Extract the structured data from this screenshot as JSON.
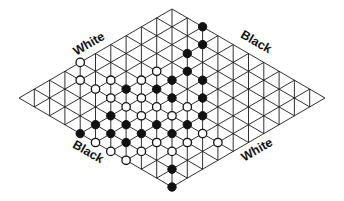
{
  "diagram": {
    "type": "hex-board",
    "size": 11,
    "geometry": {
      "left_corner": [
        19,
        98
      ],
      "step_a": [
        15.3,
        -8.9
      ],
      "step_b": [
        15.3,
        8.9
      ],
      "stone_radius": 4.2
    },
    "colors": {
      "line": "#1a1a1a",
      "black": "#111111",
      "white": "#ffffff"
    },
    "labels": [
      {
        "id": "top-left",
        "text": "White",
        "x": 89,
        "y": 44,
        "angle": -30
      },
      {
        "id": "top-right",
        "text": "Black",
        "x": 256,
        "y": 42,
        "angle": 30
      },
      {
        "id": "bottom-left",
        "text": "Black",
        "x": 88,
        "y": 152,
        "angle": 30
      },
      {
        "id": "bottom-right",
        "text": "White",
        "x": 257,
        "y": 150,
        "angle": -30
      }
    ],
    "black_stones": [
      [
        10,
        2
      ],
      [
        9,
        3
      ],
      [
        8,
        3
      ],
      [
        7,
        4
      ],
      [
        6,
        4
      ],
      [
        7,
        5
      ],
      [
        5,
        4
      ],
      [
        4,
        3
      ],
      [
        5,
        5
      ],
      [
        6,
        6
      ],
      [
        5,
        7
      ],
      [
        4,
        7
      ],
      [
        3,
        6
      ],
      [
        2,
        4
      ],
      [
        1,
        4
      ],
      [
        0,
        4
      ],
      [
        2,
        5
      ],
      [
        1,
        5
      ],
      [
        2,
        6
      ],
      [
        3,
        7
      ],
      [
        1,
        6
      ],
      [
        1,
        9
      ],
      [
        0,
        10
      ]
    ],
    "white_stones": [
      [
        4,
        0
      ],
      [
        3,
        1
      ],
      [
        3,
        2
      ],
      [
        4,
        2
      ],
      [
        3,
        3
      ],
      [
        3,
        4
      ],
      [
        5,
        3
      ],
      [
        6,
        3
      ],
      [
        4,
        4
      ],
      [
        4,
        5
      ],
      [
        3,
        5
      ],
      [
        5,
        6
      ],
      [
        4,
        6
      ],
      [
        4,
        8
      ],
      [
        3,
        8
      ],
      [
        4,
        9
      ],
      [
        2,
        7
      ],
      [
        2,
        8
      ],
      [
        1,
        7
      ],
      [
        0,
        5
      ],
      [
        0,
        6
      ],
      [
        0,
        7
      ]
    ]
  }
}
